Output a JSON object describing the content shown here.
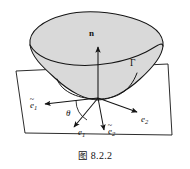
{
  "figure": {
    "caption_prefix": "图",
    "caption_number": "8.2.2",
    "caption_full": "图 8.2.2",
    "surface_fill_color": "#d9d9d9",
    "stroke_color": "#1a1a1a",
    "background_color": "#ffffff"
  },
  "labels": {
    "normal": "n",
    "curve": "Γ",
    "angle": "θ",
    "e1_tilde_base": "e",
    "e1_tilde_sub": "1",
    "e1_tilde_accent": "~",
    "e2_tilde_base": "e",
    "e2_tilde_sub": "2",
    "e2_tilde_accent": "~",
    "e1_base": "e",
    "e1_sub": "1",
    "e2_base": "e",
    "e2_sub": "2"
  },
  "geometry": {
    "origin_x": 98,
    "origin_y": 98,
    "normal_tip_x": 98,
    "normal_tip_y": 46,
    "e1_tilde_tip_x": 44,
    "e1_tilde_tip_y": 104,
    "e1_tip_x": 73,
    "e1_tip_y": 128,
    "e2_tilde_tip_x": 105,
    "e2_tilde_tip_y": 131,
    "e2_tip_x": 138,
    "e2_tip_y": 113,
    "plane_corners": "16,71 168,64 172,135 25,133"
  }
}
